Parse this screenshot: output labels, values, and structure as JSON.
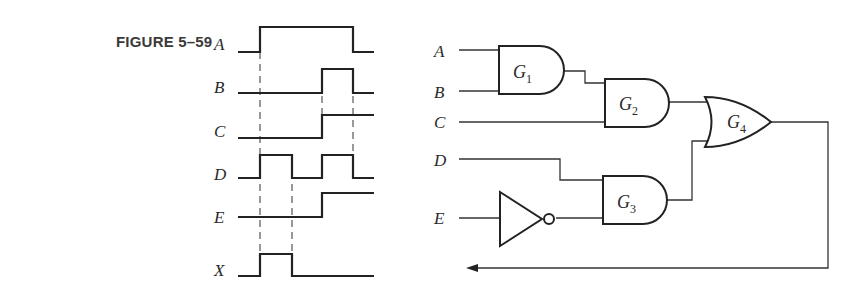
{
  "figure": {
    "label": "FIGURE 5–59"
  },
  "timing_diagram": {
    "signals": [
      {
        "name": "A",
        "transitions": "low → high at t1, high → low at t4"
      },
      {
        "name": "B",
        "transitions": "low → high at t3, high → low at t4"
      },
      {
        "name": "C",
        "transitions": "low → high at t3, stays high"
      },
      {
        "name": "D",
        "transitions": "high t1–t2, high t3–t4"
      },
      {
        "name": "E",
        "transitions": "low → high at t3, stays high"
      },
      {
        "name": "X",
        "transitions": "high t1–t2 only"
      }
    ],
    "labels": {
      "A": "A",
      "B": "B",
      "C": "C",
      "D": "D",
      "E": "E",
      "X": "X"
    },
    "guide_lines": [
      "t1",
      "t2",
      "t3",
      "t4"
    ]
  },
  "circuit": {
    "inputs": {
      "A": "A",
      "B": "B",
      "C": "C",
      "D": "D",
      "E": "E"
    },
    "gates": [
      {
        "id": "G1",
        "letter": "G",
        "sub": "1",
        "type": "AND",
        "inputs": [
          "A",
          "B"
        ]
      },
      {
        "id": "G2",
        "letter": "G",
        "sub": "2",
        "type": "AND",
        "inputs": [
          "G1",
          "C"
        ]
      },
      {
        "id": "G3",
        "letter": "G",
        "sub": "3",
        "type": "AND",
        "inputs": [
          "D",
          "NOT E"
        ]
      },
      {
        "id": "G4",
        "letter": "G",
        "sub": "4",
        "type": "OR",
        "inputs": [
          "G2",
          "G3"
        ]
      }
    ],
    "inverter": {
      "input": "E",
      "type": "NOT"
    },
    "output": "feedback arrow to X"
  }
}
